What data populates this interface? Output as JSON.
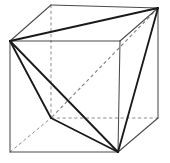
{
  "figure": {
    "title": "Cube with inscribed regular tetrahedron",
    "background_color": "#ffffff",
    "canvas": {
      "width": 170,
      "height": 163
    },
    "colors": {
      "cube_visible_edge": "#4a4a4a",
      "cube_hidden_edge": "#8c8c8c",
      "tetrahedron_visible_edge": "#1a1a1a",
      "tetrahedron_hidden_edge": "#858585",
      "face": "#ffffff"
    },
    "vertices": {
      "front_top_left": {
        "label": "A",
        "x": 10,
        "y": 41
      },
      "front_top_right": {
        "label": "B",
        "x": 120,
        "y": 41
      },
      "front_bottom_right": {
        "label": "C",
        "x": 118,
        "y": 152
      },
      "front_bottom_left": {
        "label": "D",
        "x": 10,
        "y": 152
      },
      "back_top_left": {
        "label": "E",
        "x": 51,
        "y": 5
      },
      "back_top_right": {
        "label": "F",
        "x": 158,
        "y": 8
      },
      "back_bottom_right": {
        "label": "G",
        "x": 158,
        "y": 118
      },
      "back_bottom_left": {
        "label": "H",
        "x": 51,
        "y": 118
      }
    },
    "cube_edges_visible": [
      {
        "name": "front-top",
        "x1": 10,
        "y1": 41,
        "x2": 120,
        "y2": 41
      },
      {
        "name": "front-right",
        "x1": 120,
        "y1": 41,
        "x2": 118,
        "y2": 152
      },
      {
        "name": "front-bottom",
        "x1": 118,
        "y1": 152,
        "x2": 10,
        "y2": 152
      },
      {
        "name": "front-left",
        "x1": 10,
        "y1": 152,
        "x2": 10,
        "y2": 41
      },
      {
        "name": "back-top",
        "x1": 51,
        "y1": 5,
        "x2": 158,
        "y2": 8
      },
      {
        "name": "back-right",
        "x1": 158,
        "y1": 8,
        "x2": 158,
        "y2": 118
      },
      {
        "name": "top-left-connector",
        "x1": 10,
        "y1": 41,
        "x2": 51,
        "y2": 5
      },
      {
        "name": "top-right-connector",
        "x1": 120,
        "y1": 41,
        "x2": 158,
        "y2": 8
      },
      {
        "name": "bottom-right-connector",
        "x1": 118,
        "y1": 152,
        "x2": 158,
        "y2": 118
      }
    ],
    "cube_edges_hidden": [
      {
        "name": "back-left-vertical",
        "x1": 51,
        "y1": 5,
        "x2": 51,
        "y2": 118
      },
      {
        "name": "back-bottom",
        "x1": 51,
        "y1": 118,
        "x2": 158,
        "y2": 118
      },
      {
        "name": "bottom-left-connector",
        "x1": 10,
        "y1": 152,
        "x2": 51,
        "y2": 118
      }
    ],
    "tetrahedron": {
      "vertex_keys": [
        "front_top_left",
        "back_top_right",
        "back_bottom_left",
        "front_bottom_right"
      ],
      "edges_visible": [
        {
          "name": "A-F-top-diagonal",
          "x1": 10,
          "y1": 41,
          "x2": 158,
          "y2": 8
        },
        {
          "name": "A-H-left-diagonal",
          "x1": 10,
          "y1": 41,
          "x2": 51,
          "y2": 118
        },
        {
          "name": "A-C-front-diagonal",
          "x1": 10,
          "y1": 41,
          "x2": 118,
          "y2": 152
        },
        {
          "name": "H-C-bottom-diagonal",
          "x1": 51,
          "y1": 118,
          "x2": 118,
          "y2": 152
        },
        {
          "name": "F-C-right-diagonal",
          "x1": 158,
          "y1": 8,
          "x2": 118,
          "y2": 152
        }
      ],
      "edges_hidden": [
        {
          "name": "F-H-back-diagonal",
          "x1": 158,
          "y1": 8,
          "x2": 51,
          "y2": 118
        }
      ]
    }
  }
}
